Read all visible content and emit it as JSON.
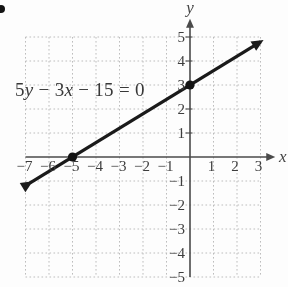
{
  "page": {
    "bullet_marker": "list-bullet",
    "background_color": "#fdfdfd"
  },
  "chart_data": {
    "type": "line",
    "title": "",
    "equation_label": "5y − 3x − 15 = 0",
    "equation_parts": [
      {
        "text": "5",
        "italic": false
      },
      {
        "text": "y",
        "italic": true
      },
      {
        "text": " − 3",
        "italic": false
      },
      {
        "text": "x",
        "italic": true
      },
      {
        "text": " − 15 = 0",
        "italic": false
      }
    ],
    "xlabel": "x",
    "ylabel": "y",
    "xlim": [
      -7,
      3
    ],
    "ylim": [
      -5,
      5
    ],
    "x_ticks": [
      -7,
      -6,
      -5,
      -4,
      -3,
      -2,
      -1,
      1,
      2,
      3
    ],
    "y_ticks": [
      5,
      4,
      3,
      2,
      1,
      -1,
      -2,
      -3,
      -4,
      -5
    ],
    "grid": true,
    "grid_style": "dotted",
    "legend": "none",
    "series": [
      {
        "name": "5y − 3x − 15 = 0",
        "slope": 0.6,
        "y_intercept": 3,
        "x_intercept": -5,
        "points": [
          {
            "x": -5,
            "y": 0
          },
          {
            "x": 0,
            "y": 3
          }
        ],
        "draw_range_x": [
          -6.82,
          3.0
        ],
        "arrows": "both"
      }
    ],
    "marked_points": [
      {
        "x": -5,
        "y": 0,
        "label": ""
      },
      {
        "x": 0,
        "y": 3,
        "label": ""
      }
    ],
    "colors": {
      "line": "#1a1a1a",
      "axis": "#4a4a4a",
      "grid": "#bdbdbd",
      "text": "#3d3d3d",
      "point": "#131313",
      "background": "#fdfdfd"
    }
  }
}
